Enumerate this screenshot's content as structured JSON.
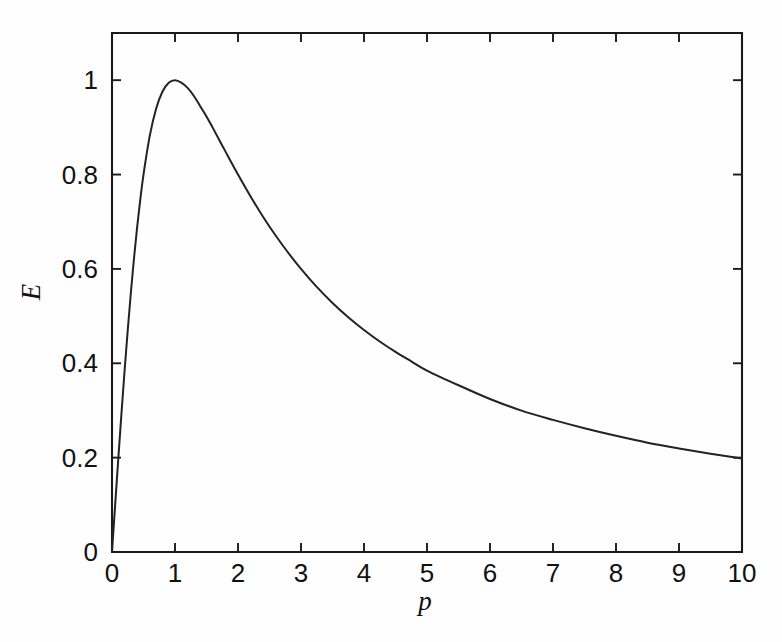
{
  "chart_data": {
    "type": "line",
    "title": "",
    "xlabel": "p",
    "ylabel": "E",
    "xlim": [
      0,
      10
    ],
    "ylim": [
      0,
      1.1
    ],
    "grid": false,
    "legend": null,
    "x_ticks": [
      0,
      1,
      2,
      3,
      4,
      5,
      6,
      7,
      8,
      9,
      10
    ],
    "x_tick_labels": [
      "0",
      "1",
      "2",
      "3",
      "4",
      "5",
      "6",
      "7",
      "8",
      "9",
      "10"
    ],
    "y_ticks": [
      0,
      0.2,
      0.4,
      0.6,
      0.8,
      1
    ],
    "y_tick_labels": [
      "0",
      "0.2",
      "0.4",
      "0.6",
      "0.8",
      "1"
    ],
    "series": [
      {
        "name": "E(p)",
        "formula": "E = 2p / (1 + p^2)",
        "color": "#222222",
        "x": [
          0,
          0.05,
          0.1,
          0.15,
          0.2,
          0.25,
          0.3,
          0.35,
          0.4,
          0.45,
          0.5,
          0.6,
          0.7,
          0.8,
          0.9,
          1,
          1.1,
          1.2,
          1.3,
          1.4,
          1.5,
          1.6,
          1.8,
          2,
          2.2,
          2.4,
          2.6,
          2.8,
          3,
          3.25,
          3.5,
          3.75,
          4,
          4.25,
          4.5,
          4.75,
          5,
          5.5,
          6,
          6.5,
          7,
          7.5,
          8,
          8.5,
          9,
          9.5,
          10
        ],
        "values": [
          0,
          0.0999,
          0.198,
          0.2933,
          0.3846,
          0.4706,
          0.5505,
          0.6236,
          0.6897,
          0.7485,
          0.8,
          0.8824,
          0.9396,
          0.9756,
          0.9945,
          1,
          0.995,
          0.9836,
          0.9665,
          0.9449,
          0.9231,
          0.8989,
          0.8491,
          0.8,
          0.7534,
          0.7101,
          0.6702,
          0.6337,
          0.6,
          0.5618,
          0.5279,
          0.4977,
          0.4706,
          0.4462,
          0.4242,
          0.4041,
          0.3846,
          0.3534,
          0.3243,
          0.2996,
          0.28,
          0.2623,
          0.2462,
          0.2316,
          0.2195,
          0.2082,
          0.198
        ]
      }
    ],
    "annotations": [],
    "peak": {
      "x": 1,
      "y": 1
    },
    "endpoint": {
      "x": 10,
      "y": 0.198
    }
  },
  "axes": {
    "y_axis_title": "E",
    "x_axis_title": "p"
  },
  "colors": {
    "curve": "#222222",
    "axis": "#1a1a1a",
    "text": "#111111",
    "background": "#fefefe"
  }
}
